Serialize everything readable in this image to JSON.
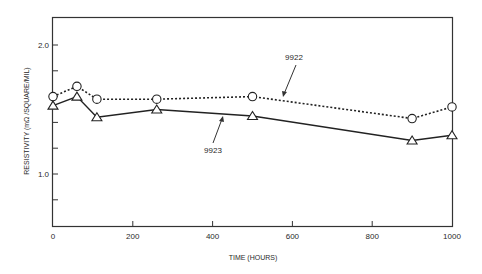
{
  "chart_data": {
    "type": "line",
    "title": "",
    "xlabel": "TIME (HOURS)",
    "ylabel": "RESISTIVITY (mΩ /SQUARE/MIL)",
    "xlim": [
      0,
      1000
    ],
    "ylim": [
      0.6,
      2.22
    ],
    "xticks": [
      0,
      200,
      400,
      600,
      800,
      1000
    ],
    "xtick_labels": [
      "0",
      "200",
      "400",
      "600",
      "800",
      "1000"
    ],
    "yticks_labeled": [
      1.0,
      2.0
    ],
    "ytick_labels": [
      "1.0",
      "2.0"
    ],
    "yticks_minor": [
      0.8,
      1.2,
      1.4,
      1.6,
      1.8
    ],
    "grid": false,
    "legend": "none (inline annotations with arrows)",
    "x": [
      0,
      60,
      110,
      260,
      500,
      900,
      1000
    ],
    "series": [
      {
        "name": "9922",
        "marker": "circle",
        "line_style": "dotted",
        "values": [
          1.6,
          1.68,
          1.58,
          1.58,
          1.6,
          1.43,
          1.52
        ]
      },
      {
        "name": "9923",
        "marker": "triangle",
        "line_style": "solid",
        "values": [
          1.53,
          1.6,
          1.44,
          1.5,
          1.45,
          1.26,
          1.3
        ]
      }
    ],
    "annotations": [
      {
        "text": "9922",
        "points_to_series": "9922"
      },
      {
        "text": "9923",
        "points_to_series": "9923"
      }
    ]
  },
  "colors": {
    "ink": "#1a1a1a",
    "background": "#ffffff"
  }
}
